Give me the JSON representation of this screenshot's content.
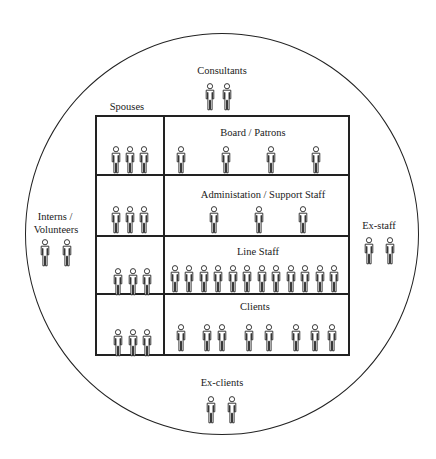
{
  "diagram": {
    "title": "",
    "outer_circle": {
      "label": ""
    },
    "colors": {
      "line": "#222222",
      "background": "#ffffff"
    },
    "outside_groups": [
      {
        "id": "consultants",
        "label": "Consultants",
        "count": 2
      },
      {
        "id": "interns",
        "label": "Interns / Volunteers",
        "label_lines": [
          "Interns /",
          "Volunteers"
        ],
        "count": 2
      },
      {
        "id": "ex_staff",
        "label": "Ex-staff",
        "count": 2
      },
      {
        "id": "ex_clients",
        "label": "Ex-clients",
        "count": 2
      }
    ],
    "spouses": {
      "label": "Spouses",
      "counts_per_row": [
        3,
        3,
        3,
        3
      ]
    },
    "rows": [
      {
        "id": "board",
        "label": "Board / Patrons",
        "count": 4
      },
      {
        "id": "admin",
        "label": "Administation / Support Staff",
        "count": 3
      },
      {
        "id": "line_staff",
        "label": "Line Staff",
        "count": 12
      },
      {
        "id": "clients",
        "label": "Clients",
        "count": 8
      }
    ],
    "icon": "person-icon"
  }
}
